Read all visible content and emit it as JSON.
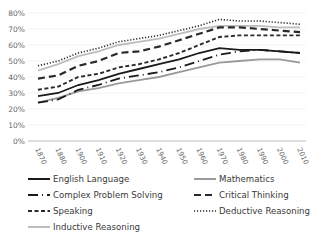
{
  "chart_data": {
    "type": "line",
    "title": "",
    "xlabel": "",
    "ylabel": "",
    "ylim": [
      0,
      80
    ],
    "grid": true,
    "legend_position": "bottom",
    "y_ticks": [
      "0%",
      "10%",
      "20%",
      "30%",
      "40%",
      "50%",
      "60%",
      "70%",
      "80%"
    ],
    "categories": [
      "1870",
      "1880",
      "1900",
      "1910",
      "1920",
      "1930",
      "1940",
      "1950",
      "1960",
      "1970",
      "1980",
      "1990",
      "2000",
      "2010"
    ],
    "series": [
      {
        "name": "English Language",
        "style": "solid",
        "color": "#1a1a1a",
        "values": [
          28,
          30,
          35,
          38,
          42,
          45,
          48,
          51,
          55,
          58,
          57,
          57,
          56,
          55
        ]
      },
      {
        "name": "Mathematics",
        "style": "solid",
        "color": "#9a9a9a",
        "values": [
          24,
          27,
          31,
          33,
          36,
          38,
          40,
          43,
          46,
          49,
          50,
          51,
          51,
          49
        ]
      },
      {
        "name": "Complex Problem Solving",
        "style": "dashdot",
        "color": "#1a1a1a",
        "values": [
          24,
          26,
          32,
          35,
          39,
          41,
          43,
          46,
          50,
          54,
          56,
          57,
          56,
          55
        ]
      },
      {
        "name": "Critical Thinking",
        "style": "longdash",
        "color": "#2a2a2a",
        "values": [
          39,
          41,
          47,
          50,
          55,
          56,
          59,
          63,
          67,
          71,
          71,
          70,
          69,
          68
        ]
      },
      {
        "name": "Speaking",
        "style": "shortdash",
        "color": "#2a2a2a",
        "values": [
          32,
          34,
          40,
          42,
          46,
          48,
          51,
          55,
          60,
          65,
          66,
          66,
          66,
          66
        ]
      },
      {
        "name": "Deductive Reasoning",
        "style": "dotted",
        "color": "#2a2a2a",
        "values": [
          47,
          50,
          55,
          58,
          62,
          64,
          66,
          69,
          72,
          76,
          75,
          75,
          74,
          73
        ]
      },
      {
        "name": "Inductive Reasoning",
        "style": "solid",
        "color": "#bdbdbd",
        "values": [
          44,
          48,
          53,
          56,
          60,
          62,
          64,
          67,
          70,
          72,
          72,
          72,
          71,
          71
        ]
      }
    ]
  },
  "legend": {
    "items": [
      {
        "label": "English Language"
      },
      {
        "label": "Mathematics"
      },
      {
        "label": "Complex Problem Solving"
      },
      {
        "label": "Critical Thinking"
      },
      {
        "label": "Speaking"
      },
      {
        "label": "Deductive Reasoning"
      },
      {
        "label": "Inductive Reasoning"
      }
    ]
  }
}
